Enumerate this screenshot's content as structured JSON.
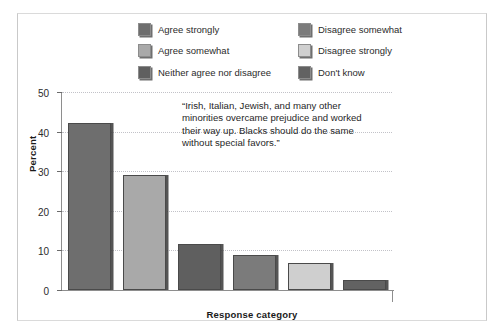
{
  "chart_data": {
    "type": "bar",
    "title": "",
    "xlabel": "Response category",
    "ylabel": "Percent",
    "ylim": [
      0,
      50
    ],
    "yticks": [
      0,
      10,
      20,
      30,
      40,
      50
    ],
    "grid": true,
    "legend_position": "top",
    "categories": [
      "Agree strongly",
      "Agree somewhat",
      "Neither agree nor disagree",
      "Disagree somewhat",
      "Disagree strongly",
      "Don't know"
    ],
    "values": [
      42.3,
      29.0,
      11.5,
      8.8,
      6.9,
      2.5
    ],
    "colors": [
      "#6e6e6e",
      "#a9a9a9",
      "#5f5f5f",
      "#7b7b7b",
      "#cfcfcf",
      "#626262"
    ],
    "annotations": [
      {
        "name": "quote",
        "text": "“Irish, Italian, Jewish, and many other minorities overcame prejudice and worked their way up. Blacks should do the same without special favors.”"
      }
    ]
  },
  "legend": {
    "items": [
      {
        "label": "Agree strongly",
        "color": "#6e6e6e"
      },
      {
        "label": "Disagree somewhat",
        "color": "#7b7b7b"
      },
      {
        "label": "Agree somewhat",
        "color": "#a9a9a9"
      },
      {
        "label": "Disagree strongly",
        "color": "#cfcfcf"
      },
      {
        "label": "Neither agree nor disagree",
        "color": "#5f5f5f"
      },
      {
        "label": "Don't know",
        "color": "#626262"
      }
    ]
  },
  "axes": {
    "y_title": "Percent",
    "x_title": "Response category",
    "y_tick_labels": [
      "50",
      "40",
      "30",
      "20",
      "10",
      "0"
    ]
  }
}
